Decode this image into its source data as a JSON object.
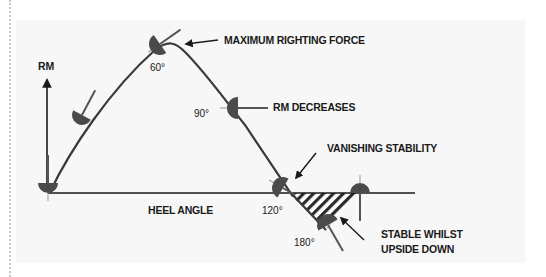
{
  "diagram": {
    "axes": {
      "y_label": "RM",
      "x_label": "HEEL ANGLE"
    },
    "angle_labels": {
      "a60": "60°",
      "a90": "90°",
      "a120": "120°",
      "a180": "180°"
    },
    "annotations": {
      "max_force": "MAXIMUM RIGHTING FORCE",
      "rm_decreases": "RM DECREASES",
      "vanishing": "VANISHING STABILITY",
      "stable_line1": "STABLE WHILST",
      "stable_line2": "UPSIDE DOWN"
    },
    "colors": {
      "panel_bg": "#f7f7f7",
      "line": "#2b2b2b",
      "boat": "#4a4a4a",
      "text": "#1a1a1a"
    }
  }
}
